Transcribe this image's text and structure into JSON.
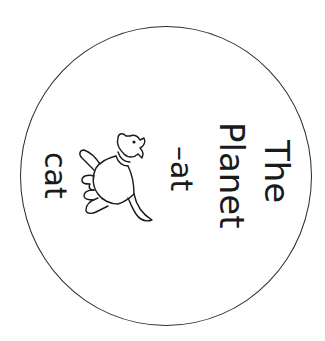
{
  "worksheet": {
    "title_line1": "The",
    "title_line2": "Planet",
    "word_family": "–at",
    "example_word": "cat",
    "illustration": "cat-icon",
    "rotation_degrees": 90
  },
  "colors": {
    "ink": "#1a1a1a",
    "background": "#ffffff"
  }
}
